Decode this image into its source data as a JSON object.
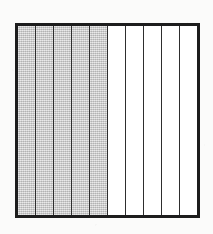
{
  "figure": {
    "shape": "rectangle",
    "border_color": "#1d1d1d",
    "divider_color": "#2e2e2e",
    "shaded_color": "#c9c9c9",
    "unshaded_color": "#ffffff",
    "background_color": "#fbfbfa"
  },
  "chart_data": {
    "type": "bar",
    "xlabel": "",
    "ylabel": "",
    "orientation": "vertical-strips",
    "total_parts": 10,
    "shaded_parts": 5,
    "unshaded_parts": 5,
    "fraction": "5/10",
    "simplified_fraction": "1/2",
    "decimal": 0.5,
    "percent": 50,
    "categories": [
      "1",
      "2",
      "3",
      "4",
      "5",
      "6",
      "7",
      "8",
      "9",
      "10"
    ],
    "values": [
      1,
      1,
      1,
      1,
      1,
      0,
      0,
      0,
      0,
      0
    ],
    "legend": [],
    "grid": false
  },
  "strips": [
    {
      "index": 1,
      "state": "shaded",
      "label": "part-1"
    },
    {
      "index": 2,
      "state": "shaded",
      "label": "part-2"
    },
    {
      "index": 3,
      "state": "shaded",
      "label": "part-3"
    },
    {
      "index": 4,
      "state": "shaded",
      "label": "part-4"
    },
    {
      "index": 5,
      "state": "shaded",
      "label": "part-5"
    },
    {
      "index": 6,
      "state": "unshaded",
      "label": "part-6"
    },
    {
      "index": 7,
      "state": "unshaded",
      "label": "part-7"
    },
    {
      "index": 8,
      "state": "unshaded",
      "label": "part-8"
    },
    {
      "index": 9,
      "state": "unshaded",
      "label": "part-9"
    },
    {
      "index": 10,
      "state": "unshaded",
      "label": "part-10"
    }
  ]
}
